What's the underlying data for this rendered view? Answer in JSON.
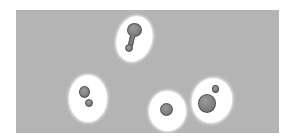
{
  "image": {
    "description": "Micrograph of budding cells with white halos on gray background",
    "background_color": "#b4b4b4",
    "halo_color": "#ffffff",
    "cell_color": "#808080",
    "cells": [
      {
        "id": "cell-1",
        "type": "budding-elongated"
      },
      {
        "id": "cell-2",
        "type": "budding-pair"
      },
      {
        "id": "cell-3",
        "type": "single-round"
      },
      {
        "id": "cell-4",
        "type": "budding-large"
      }
    ]
  }
}
